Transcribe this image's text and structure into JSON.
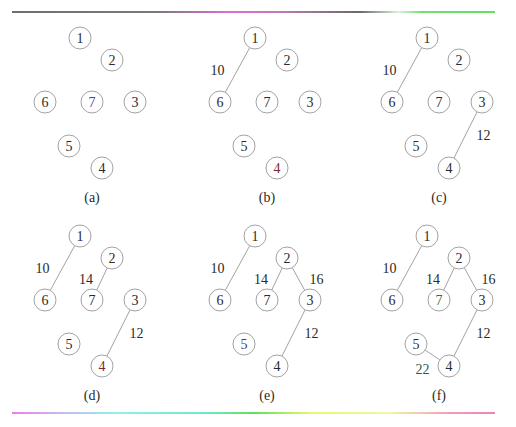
{
  "figure": {
    "node_radius": 11,
    "nodes": [
      {
        "id": "1",
        "label": "1",
        "x": 80,
        "y": 38
      },
      {
        "id": "2",
        "label": "2",
        "x": 112,
        "y": 60
      },
      {
        "id": "3",
        "label": "3",
        "x": 135,
        "y": 102
      },
      {
        "id": "4",
        "label": "4",
        "x": 102,
        "y": 168
      },
      {
        "id": "5",
        "label": "5",
        "x": 69,
        "y": 146
      },
      {
        "id": "6",
        "label": "6",
        "x": 45,
        "y": 102
      },
      {
        "id": "7",
        "label": "7",
        "x": 92,
        "y": 102
      }
    ],
    "node_text_colors": {
      "default": "#2a2a2a"
    },
    "panels": [
      {
        "id": "a",
        "caption": "(a)",
        "dx": 0,
        "dy": 0,
        "edges": [],
        "node_colors": {
          "7": "#4a3f9a"
        }
      },
      {
        "id": "b",
        "caption": "(b)",
        "dx": 175,
        "dy": 0,
        "edges": [
          {
            "from": "1",
            "to": "6",
            "weight": "10",
            "lx": -20,
            "ly": 0
          }
        ],
        "node_colors": {
          "4": "#7a2a2a"
        }
      },
      {
        "id": "c",
        "caption": "(c)",
        "dx": 347,
        "dy": 0,
        "edges": [
          {
            "from": "1",
            "to": "6",
            "weight": "10",
            "lx": -20,
            "ly": 0
          },
          {
            "from": "3",
            "to": "4",
            "weight": "12",
            "lx": 18,
            "ly": 0
          }
        ],
        "node_colors": {}
      },
      {
        "id": "d",
        "caption": "(d)",
        "dx": 0,
        "dy": 198,
        "edges": [
          {
            "from": "1",
            "to": "6",
            "weight": "10",
            "lx": -20,
            "ly": 0
          },
          {
            "from": "2",
            "to": "7",
            "weight": "14",
            "lx": -16,
            "ly": 0
          },
          {
            "from": "3",
            "to": "4",
            "weight": "12",
            "lx": 18,
            "ly": 0
          }
        ],
        "node_colors": {
          "4": "#7a2a2a"
        }
      },
      {
        "id": "e",
        "caption": "(e)",
        "dx": 175,
        "dy": 198,
        "edges": [
          {
            "from": "1",
            "to": "6",
            "weight": "10",
            "lx": -20,
            "ly": 0
          },
          {
            "from": "2",
            "to": "7",
            "weight": "14",
            "lx": -16,
            "ly": 0
          },
          {
            "from": "2",
            "to": "3",
            "weight": "16",
            "lx": 18,
            "ly": 0
          },
          {
            "from": "3",
            "to": "4",
            "weight": "12",
            "lx": 18,
            "ly": 0
          }
        ],
        "node_colors": {
          "5": "#3a3a7a"
        }
      },
      {
        "id": "f",
        "caption": "(f)",
        "dx": 347,
        "dy": 198,
        "edges": [
          {
            "from": "1",
            "to": "6",
            "weight": "10",
            "lx": -20,
            "ly": 0
          },
          {
            "from": "2",
            "to": "7",
            "weight": "14",
            "lx": -16,
            "ly": 0
          },
          {
            "from": "2",
            "to": "3",
            "weight": "16",
            "lx": 18,
            "ly": 0
          },
          {
            "from": "3",
            "to": "4",
            "weight": "12",
            "lx": 18,
            "ly": 0
          },
          {
            "from": "5",
            "to": "4",
            "weight": "22",
            "lx": -10,
            "ly": 14,
            "color": "#2a5a4a"
          }
        ],
        "node_colors": {
          "7": "#3a6a3a"
        }
      }
    ],
    "caption_pos": {
      "x": 92,
      "y": 197
    }
  }
}
